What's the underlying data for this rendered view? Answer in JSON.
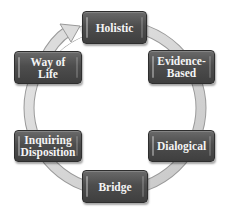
{
  "diagram": {
    "type": "cycle",
    "colors": {
      "node_fill": "#4d4d4d",
      "node_text": "#f4f4f4",
      "ring_fill": "#d9d9d9",
      "ring_edge": "#a6a6a6"
    },
    "nodes": [
      {
        "id": "holistic",
        "label": "Holistic"
      },
      {
        "id": "evidence-based",
        "label": "Evidence-\nBased"
      },
      {
        "id": "dialogical",
        "label": "Dialogical"
      },
      {
        "id": "bridge",
        "label": "Bridge"
      },
      {
        "id": "inquiring-disposition",
        "label": "Inquiring\nDisposition"
      },
      {
        "id": "way-of-life",
        "label": "Way of Life"
      }
    ],
    "flow_direction": "clockwise",
    "arrow": {
      "from": "way-of-life",
      "to": "holistic"
    }
  }
}
